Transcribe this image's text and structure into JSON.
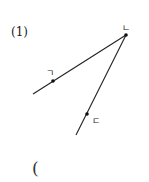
{
  "problem": {
    "number_label": "(1)",
    "answer_open_paren": "("
  },
  "diagram": {
    "points": [
      {
        "id": "giyeok",
        "label": "ㄱ"
      },
      {
        "id": "nieun",
        "label": "ㄴ"
      },
      {
        "id": "digeut",
        "label": "ㄷ"
      }
    ],
    "rays": [
      {
        "from": "ㄴ",
        "through": "ㄱ"
      },
      {
        "from": "ㄴ",
        "through": "ㄷ"
      }
    ]
  }
}
